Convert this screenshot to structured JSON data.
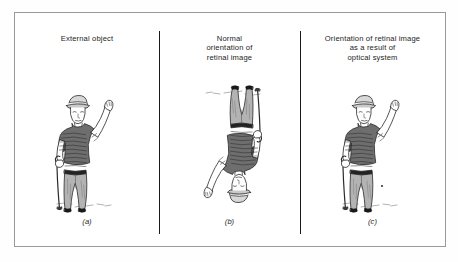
{
  "figure": {
    "background_color": "#ffffff",
    "frame_border_color": "#9a9a9a",
    "divider_color": "#1a1a1a",
    "ink_color": "#1d1d1d",
    "shirt_fill": "#6e6e6e",
    "trouser_fill": "#b3b3b3",
    "skin_fill": "#ffffff",
    "shoe_fill": "#1a1a1a"
  },
  "panels": [
    {
      "id": "a",
      "title": "External object",
      "caption": "(a)",
      "figure_name": "man-with-cane-upright",
      "orientation": "upright"
    },
    {
      "id": "b",
      "title": "Normal\norientation of\nretinal image",
      "caption": "(b)",
      "figure_name": "man-with-cane-inverted",
      "orientation": "inverted"
    },
    {
      "id": "c",
      "title": "Orientation of retinal image\nas a result of\noptical system",
      "caption": "(c)",
      "figure_name": "man-with-cane-upright",
      "orientation": "upright"
    }
  ]
}
